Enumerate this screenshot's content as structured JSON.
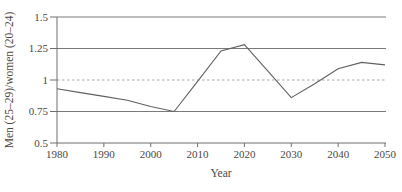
{
  "figure": {
    "background": "#ffffff"
  },
  "chart_data": {
    "type": "line",
    "title": "",
    "xlabel": "Year",
    "ylabel": "Men (25–29)/women (20–24)",
    "series_name": "men-25-29-to-women-20-24-ratio",
    "x": [
      1980,
      1985,
      1990,
      1995,
      2000,
      2005,
      2010,
      2015,
      2020,
      2025,
      2030,
      2035,
      2040,
      2045,
      2050
    ],
    "values": [
      0.93,
      0.9,
      0.87,
      0.84,
      0.79,
      0.75,
      0.99,
      1.23,
      1.28,
      1.07,
      0.86,
      0.97,
      1.09,
      1.14,
      1.12
    ],
    "xlim": [
      1980,
      2050
    ],
    "ylim": [
      0.5,
      1.5
    ],
    "xticks": [
      1980,
      1990,
      2000,
      2010,
      2020,
      2030,
      2040,
      2050
    ],
    "yticks": [
      0.5,
      0.75,
      1,
      1.25,
      1.5
    ],
    "ytick_labels": [
      "0.5",
      "0.75",
      "1",
      "1.25",
      "1.5"
    ],
    "grid": {
      "solid_y": [
        0.75,
        1.25,
        1.5
      ],
      "dashed_y": [
        1
      ]
    },
    "legend": "none",
    "colors": {
      "line": "#606060",
      "grid": "#7a7a7a",
      "dashed": "#a8a8a8",
      "axis": "#6e6e6e",
      "text": "#4b4742"
    }
  }
}
